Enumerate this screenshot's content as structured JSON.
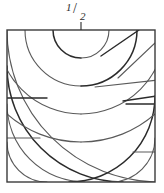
{
  "figure": {
    "background_color": "#ffffff",
    "label": {
      "text": "1/2",
      "numerator": "1",
      "slash": "/",
      "denominator": "2",
      "position": "top-center",
      "color": "#2b2b2b"
    },
    "square": {
      "x": 7,
      "y": 30,
      "width": 148,
      "height": 152,
      "stroke": "#3b3b3b",
      "stroke_width": 1.4,
      "fill": "none"
    },
    "stroke_colors": {
      "dark": "#2b2b2b",
      "mid": "#5a5a5a",
      "light": "#8a8a8a"
    },
    "arc_families": [
      {
        "name": "top-center-family",
        "center_x": 81,
        "center_y": 30,
        "radii": [
          28,
          56,
          84,
          112
        ],
        "note": "arcs centered at the 1/2 mark on the top edge"
      },
      {
        "name": "bottom-left-family",
        "center_x": 7,
        "center_y": 182,
        "radii": [
          40,
          78,
          116,
          152
        ],
        "note": "arcs centered at the bottom-left corner"
      },
      {
        "name": "bottom-right-family",
        "center_x": 155,
        "center_y": 182,
        "radii": [
          44,
          86
        ],
        "note": "arcs centered at the bottom-right corner"
      }
    ],
    "radial_lines": [
      {
        "name": "radial-1",
        "x1": 101,
        "y1": 57,
        "x2": 137,
        "y2": 30
      },
      {
        "name": "radial-2",
        "x1": 116,
        "y1": 79,
        "x2": 155,
        "y2": 44
      },
      {
        "name": "radial-3",
        "x1": 95,
        "y1": 86,
        "x2": 155,
        "y2": 79
      },
      {
        "name": "radial-4",
        "x1": 121,
        "y1": 100,
        "x2": 155,
        "y2": 95
      }
    ],
    "chords": [
      {
        "name": "chord-left-upper",
        "x1": 7,
        "y1": 98,
        "x2": 45,
        "y2": 98
      },
      {
        "name": "chord-left-lower",
        "x1": 7,
        "y1": 137,
        "x2": 38,
        "y2": 137
      },
      {
        "name": "chord-right-upper",
        "x1": 128,
        "y1": 104,
        "x2": 155,
        "y2": 104
      },
      {
        "name": "chord-right-lower",
        "x1": 134,
        "y1": 152,
        "x2": 155,
        "y2": 152
      }
    ]
  }
}
